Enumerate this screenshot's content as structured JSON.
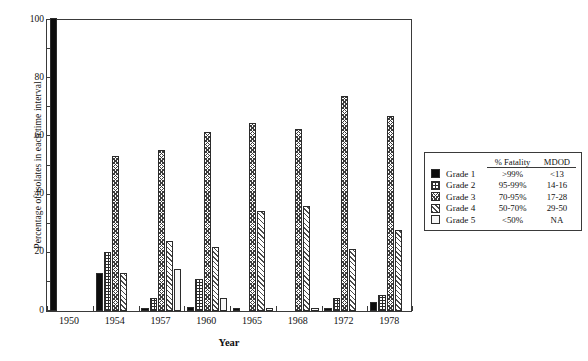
{
  "chart_data": {
    "type": "bar",
    "title": "",
    "xlabel": "Year",
    "ylabel": "Percentage of isolates in each time interval",
    "ylim": [
      0,
      100
    ],
    "yticks": [
      0,
      20,
      40,
      60,
      80,
      100
    ],
    "yticks_minor": [
      10,
      30,
      50,
      70,
      90
    ],
    "grid": false,
    "legend_position": "right",
    "categories": [
      "1950",
      "1954",
      "1957",
      "1960",
      "1965",
      "1968",
      "1972",
      "1978"
    ],
    "series": [
      {
        "name": "Grade 1",
        "values": [
          100,
          13,
          1,
          1.5,
          1,
          0,
          1,
          3
        ]
      },
      {
        "name": "Grade 2",
        "values": [
          0,
          20,
          4.5,
          11,
          0,
          0,
          4.5,
          5.5
        ]
      },
      {
        "name": "Grade 3",
        "values": [
          0,
          53,
          55,
          61,
          64,
          62,
          73.5,
          66.5
        ]
      },
      {
        "name": "Grade 4",
        "values": [
          0,
          13,
          24,
          22,
          34,
          36,
          21,
          27.5
        ]
      },
      {
        "name": "Grade 5",
        "values": [
          0,
          0,
          14.5,
          4.5,
          1,
          1,
          0,
          0
        ]
      }
    ]
  },
  "legend": {
    "headers": [
      "",
      "",
      "% Fatality",
      "MDOD"
    ],
    "rows": [
      {
        "swatch": "grade-1-swatch",
        "name": "Grade 1",
        "fatality": ">99%",
        "mdod": "<13"
      },
      {
        "swatch": "grade-2-swatch",
        "name": "Grade 2",
        "fatality": "95-99%",
        "mdod": "14-16"
      },
      {
        "swatch": "grade-3-swatch",
        "name": "Grade 3",
        "fatality": "70-95%",
        "mdod": "17-28"
      },
      {
        "swatch": "grade-4-swatch",
        "name": "Grade 4",
        "fatality": "50-70%",
        "mdod": "29-50"
      },
      {
        "swatch": "grade-5-swatch",
        "name": "Grade 5",
        "fatality": "<50%",
        "mdod": "NA"
      }
    ]
  }
}
